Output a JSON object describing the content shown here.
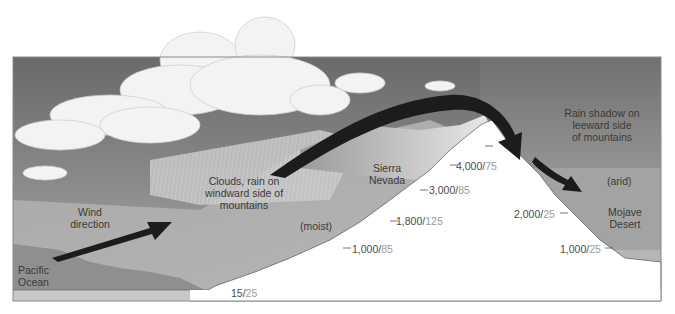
{
  "diagram": {
    "colors": {
      "sky_top": "#6e6e6e",
      "sky_mid": "#9a9a9a",
      "ocean": "#8e8e8e",
      "ground_windward": "#b0b0b0",
      "ground_leeward": "#a6a6a6",
      "mountain": "#ffffff",
      "cloud": "#f4f4f4",
      "cloud_shadow": "#cfcfcf",
      "arrow": "#1c1c1c",
      "frame": "#888888",
      "label_text": "#3a3a3a",
      "rain_value_text": "#9a9a9a"
    },
    "labels": {
      "clouds_rain": [
        "Clouds, rain on",
        "windward side of",
        "mountains"
      ],
      "wind_direction": [
        "Wind",
        "direction"
      ],
      "pacific_ocean": [
        "Pacific",
        "Ocean"
      ],
      "moist": "(moist)",
      "sierra_nevada": [
        "Sierra",
        "Nevada"
      ],
      "rain_shadow": [
        "Rain shadow on",
        "leeward side",
        "of mountains"
      ],
      "arid": "(arid)",
      "mojave_desert": [
        "Mojave",
        "Desert"
      ]
    },
    "elevation_markers": [
      {
        "elevation": "15",
        "rainfall": "25",
        "side": "windward"
      },
      {
        "elevation": "1,000",
        "rainfall": "85",
        "side": "windward"
      },
      {
        "elevation": "1,800",
        "rainfall": "125",
        "side": "windward"
      },
      {
        "elevation": "3,000",
        "rainfall": "85",
        "side": "windward"
      },
      {
        "elevation": "4,000",
        "rainfall": "75",
        "side": "windward"
      },
      {
        "elevation": "2,000",
        "rainfall": "25",
        "side": "leeward"
      },
      {
        "elevation": "1,000",
        "rainfall": "25",
        "side": "leeward"
      }
    ],
    "separator": "/"
  }
}
